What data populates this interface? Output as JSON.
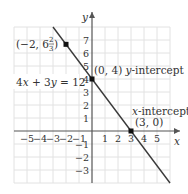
{
  "chart_data": {
    "type": "line",
    "title": "",
    "equation": "4x + 3y = 12",
    "xlabel": "x",
    "ylabel": "y",
    "xlim": [
      -6,
      6
    ],
    "ylim": [
      -4,
      8
    ],
    "grid": true,
    "x_ticks": [
      -5,
      -4,
      -3,
      -2,
      -1,
      1,
      2,
      3,
      4,
      5
    ],
    "y_ticks": [
      7,
      6,
      5,
      4,
      3,
      2,
      1,
      -1,
      -2,
      -3
    ],
    "series": [
      {
        "name": "4x + 3y = 12",
        "x": [
          -3,
          6
        ],
        "y": [
          8,
          -4
        ],
        "color": "#3a3a3a"
      }
    ],
    "points": [
      {
        "x": -2,
        "y": 6.667,
        "label": "(−2, 6 2/3)"
      },
      {
        "x": 0,
        "y": 4,
        "label": "(0, 4) y-intercept"
      },
      {
        "x": 3,
        "y": 0,
        "label": "x-intercept (3, 0)"
      }
    ],
    "annotations": {
      "point_a": {
        "text_main": "(−2, 6",
        "frac_num": "2",
        "frac_den": "3",
        "text_end": ")"
      },
      "y_intercept": {
        "coords": "(0, 4)",
        "label": "y",
        "suffix": "-intercept"
      },
      "x_intercept": {
        "label": "x",
        "suffix": "-intercept",
        "coords": "(3, 0)"
      },
      "equation": {
        "a": "4",
        "x": "x",
        "plus": " + 3",
        "y": "y",
        "rhs": " = 12"
      }
    }
  },
  "colors": {
    "grid": "#e2e2e2",
    "axis": "#555555",
    "line": "#3a3a3a",
    "point": "#111111",
    "text": "#333333"
  }
}
